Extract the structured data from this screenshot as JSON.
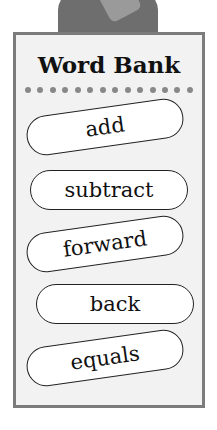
{
  "word_bank": {
    "title": "Word Bank",
    "dot_count": 14,
    "words": [
      "add",
      "subtract",
      "forward",
      "back",
      "equals"
    ]
  },
  "colors": {
    "panel_background": "#f2f2f2",
    "panel_border": "#7c7c7c",
    "dots": "#888888",
    "character": "#6e6e6e"
  }
}
